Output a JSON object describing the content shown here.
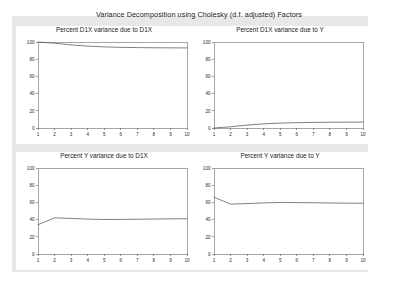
{
  "figure": {
    "title": "Variance Decomposition using Cholesky (d.f. adjusted) Factors",
    "background_color": "#e8e8e8",
    "panel_color": "#ffffff",
    "line_color": "#4a4a4a",
    "axis_color": "#5a5a5a"
  },
  "chart_data": [
    {
      "type": "line",
      "title": "Percent D1X variance due to D1X",
      "xlabel": "",
      "ylabel": "",
      "x": [
        1,
        2,
        3,
        4,
        5,
        6,
        7,
        8,
        9,
        10
      ],
      "xtick_labels": [
        "1",
        "2",
        "3",
        "4",
        "5",
        "6",
        "7",
        "8",
        "9",
        "10"
      ],
      "ytick_labels": [
        "0",
        "20",
        "40",
        "60",
        "80",
        "100"
      ],
      "yticks": [
        0,
        20,
        40,
        60,
        80,
        100
      ],
      "xlim": [
        1,
        10
      ],
      "ylim": [
        0,
        100
      ],
      "grid": false,
      "legend": "none",
      "series": [
        {
          "name": "Percent D1X variance due to D1X",
          "values": [
            100.0,
            98.6,
            96.6,
            95.2,
            94.3,
            93.8,
            93.5,
            93.3,
            93.2,
            93.1
          ]
        }
      ]
    },
    {
      "type": "line",
      "title": "Percent D1X variance due to Y",
      "xlabel": "",
      "ylabel": "",
      "x": [
        1,
        2,
        3,
        4,
        5,
        6,
        7,
        8,
        9,
        10
      ],
      "xtick_labels": [
        "1",
        "2",
        "3",
        "4",
        "5",
        "6",
        "7",
        "8",
        "9",
        "10"
      ],
      "ytick_labels": [
        "0",
        "20",
        "40",
        "60",
        "80",
        "100"
      ],
      "yticks": [
        0,
        20,
        40,
        60,
        80,
        100
      ],
      "xlim": [
        1,
        10
      ],
      "ylim": [
        0,
        100
      ],
      "grid": false,
      "legend": "none",
      "series": [
        {
          "name": "Percent D1X variance due to Y",
          "values": [
            0.0,
            1.4,
            3.4,
            4.8,
            5.7,
            6.2,
            6.5,
            6.7,
            6.8,
            6.9
          ]
        }
      ]
    },
    {
      "type": "line",
      "title": "Percent Y variance due to D1X",
      "xlabel": "",
      "ylabel": "",
      "x": [
        1,
        2,
        3,
        4,
        5,
        6,
        7,
        8,
        9,
        10
      ],
      "xtick_labels": [
        "1",
        "2",
        "3",
        "4",
        "5",
        "6",
        "7",
        "8",
        "9",
        "10"
      ],
      "ytick_labels": [
        "0",
        "20",
        "40",
        "60",
        "80",
        "100"
      ],
      "yticks": [
        0,
        20,
        40,
        60,
        80,
        100
      ],
      "xlim": [
        1,
        10
      ],
      "ylim": [
        0,
        100
      ],
      "grid": false,
      "legend": "none",
      "series": [
        {
          "name": "Percent Y variance due to D1X",
          "values": [
            34.0,
            42.0,
            41.4,
            40.6,
            40.1,
            40.2,
            40.4,
            40.7,
            40.9,
            41.0
          ]
        }
      ]
    },
    {
      "type": "line",
      "title": "Percent Y variance due to Y",
      "xlabel": "",
      "ylabel": "",
      "x": [
        1,
        2,
        3,
        4,
        5,
        6,
        7,
        8,
        9,
        10
      ],
      "xtick_labels": [
        "1",
        "2",
        "3",
        "4",
        "5",
        "6",
        "7",
        "8",
        "9",
        "10"
      ],
      "ytick_labels": [
        "0",
        "20",
        "40",
        "60",
        "80",
        "100"
      ],
      "yticks": [
        0,
        20,
        40,
        60,
        80,
        100
      ],
      "xlim": [
        1,
        10
      ],
      "ylim": [
        0,
        100
      ],
      "grid": false,
      "legend": "none",
      "series": [
        {
          "name": "Percent Y variance due to Y",
          "values": [
            66.0,
            58.0,
            58.6,
            59.4,
            59.9,
            59.8,
            59.6,
            59.3,
            59.1,
            59.0
          ]
        }
      ]
    }
  ]
}
